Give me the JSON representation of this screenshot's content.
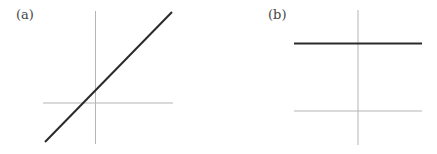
{
  "panels": [
    {
      "label": "(a)",
      "description": "Linear function with positive slope crossing axes near origin",
      "axes": {
        "vertical": {
          "x": 95.5,
          "y1": 11,
          "y2": 144
        },
        "horizontal": {
          "y": 103,
          "x1": 43,
          "x2": 173
        }
      },
      "curve": {
        "type": "line",
        "x1": 45,
        "y1": 142,
        "x2": 172,
        "y2": 12
      }
    },
    {
      "label": "(b)",
      "description": "Constant function: horizontal line above x-axis",
      "axes": {
        "vertical": {
          "x": 358,
          "y1": 10,
          "y2": 145
        },
        "horizontal": {
          "y": 111,
          "x1": 294,
          "x2": 422
        }
      },
      "curve": {
        "type": "line",
        "x1": 294,
        "y1": 43.5,
        "x2": 422,
        "y2": 43.5
      }
    }
  ],
  "colors": {
    "axis": "#b5b5b5",
    "curve": "#2a2a2a",
    "label": "#444444"
  }
}
